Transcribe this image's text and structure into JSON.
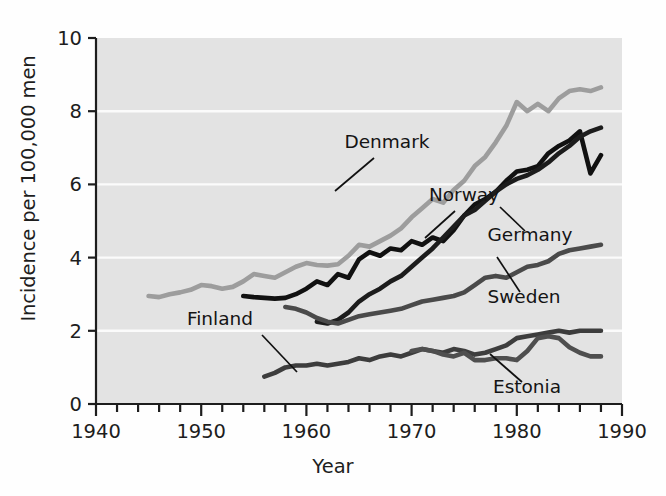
{
  "chart_data": {
    "type": "line",
    "title": "",
    "xlabel": "Year",
    "ylabel": "Incidence per 100,000 men",
    "xlim": [
      1940,
      1990
    ],
    "ylim": [
      0,
      10
    ],
    "xticks": [
      1940,
      1950,
      1960,
      1970,
      1980,
      1990
    ],
    "yticks": [
      0,
      2,
      4,
      6,
      8,
      10
    ],
    "xminor_step": 2,
    "grid": "horizontal-white-at-even-y",
    "legend": "inline-labels-with-leader-lines",
    "plot_background": "#e3e3e3",
    "series": [
      {
        "name": "Denmark",
        "color": "#9d9d9d",
        "x": [
          1945,
          1946,
          1947,
          1948,
          1949,
          1950,
          1951,
          1952,
          1953,
          1954,
          1955,
          1956,
          1957,
          1958,
          1959,
          1960,
          1961,
          1962,
          1963,
          1964,
          1965,
          1966,
          1967,
          1968,
          1969,
          1970,
          1971,
          1972,
          1973,
          1974,
          1975,
          1976,
          1977,
          1978,
          1979,
          1980,
          1981,
          1982,
          1983,
          1984,
          1985,
          1986,
          1987,
          1988
        ],
        "values": [
          2.95,
          2.92,
          3.0,
          3.05,
          3.12,
          3.25,
          3.22,
          3.15,
          3.2,
          3.35,
          3.55,
          3.5,
          3.45,
          3.6,
          3.75,
          3.85,
          3.8,
          3.78,
          3.82,
          4.05,
          4.35,
          4.3,
          4.45,
          4.6,
          4.8,
          5.1,
          5.35,
          5.6,
          5.5,
          5.85,
          6.1,
          6.5,
          6.75,
          7.15,
          7.6,
          8.25,
          8.0,
          8.2,
          8.0,
          8.35,
          8.55,
          8.6,
          8.55,
          8.65
        ]
      },
      {
        "name": "Norway",
        "color": "#111111",
        "x": [
          1954,
          1955,
          1956,
          1957,
          1958,
          1959,
          1960,
          1961,
          1962,
          1963,
          1964,
          1965,
          1966,
          1967,
          1968,
          1969,
          1970,
          1971,
          1972,
          1973,
          1974,
          1975,
          1976,
          1977,
          1978,
          1979,
          1980,
          1981,
          1982,
          1983,
          1984,
          1985,
          1986,
          1987,
          1988
        ],
        "values": [
          2.95,
          2.92,
          2.9,
          2.88,
          2.9,
          3.0,
          3.15,
          3.35,
          3.25,
          3.55,
          3.45,
          3.95,
          4.15,
          4.05,
          4.25,
          4.2,
          4.45,
          4.35,
          4.55,
          4.45,
          4.75,
          5.15,
          5.45,
          5.6,
          5.8,
          6.1,
          6.35,
          6.4,
          6.5,
          6.85,
          7.05,
          7.2,
          7.45,
          6.3,
          6.8
        ]
      },
      {
        "name": "Germany",
        "color": "#1c1c1c",
        "x": [
          1961,
          1962,
          1963,
          1964,
          1965,
          1966,
          1967,
          1968,
          1969,
          1970,
          1971,
          1972,
          1973,
          1974,
          1975,
          1976,
          1977,
          1978,
          1979,
          1980,
          1981,
          1982,
          1983,
          1984,
          1985,
          1986,
          1987,
          1988
        ],
        "values": [
          2.25,
          2.2,
          2.3,
          2.5,
          2.8,
          3.0,
          3.15,
          3.35,
          3.5,
          3.75,
          4.0,
          4.25,
          4.55,
          4.85,
          5.15,
          5.3,
          5.55,
          5.8,
          6.0,
          6.15,
          6.25,
          6.4,
          6.6,
          6.85,
          7.05,
          7.3,
          7.45,
          7.55
        ]
      },
      {
        "name": "Sweden",
        "color": "#4a4a4a",
        "x": [
          1958,
          1959,
          1960,
          1961,
          1962,
          1963,
          1964,
          1965,
          1966,
          1967,
          1968,
          1969,
          1970,
          1971,
          1972,
          1973,
          1974,
          1975,
          1976,
          1977,
          1978,
          1979,
          1980,
          1981,
          1982,
          1983,
          1984,
          1985,
          1986,
          1987,
          1988
        ],
        "values": [
          2.65,
          2.6,
          2.5,
          2.35,
          2.25,
          2.2,
          2.3,
          2.4,
          2.45,
          2.5,
          2.55,
          2.6,
          2.7,
          2.8,
          2.85,
          2.9,
          2.95,
          3.05,
          3.25,
          3.45,
          3.5,
          3.45,
          3.6,
          3.75,
          3.8,
          3.9,
          4.1,
          4.2,
          4.25,
          4.3,
          4.35
        ]
      },
      {
        "name": "Finland",
        "color": "#3d3d3d",
        "x": [
          1956,
          1957,
          1958,
          1959,
          1960,
          1961,
          1962,
          1963,
          1964,
          1965,
          1966,
          1967,
          1968,
          1969,
          1970,
          1971,
          1972,
          1973,
          1974,
          1975,
          1976,
          1977,
          1978,
          1979,
          1980,
          1981,
          1982,
          1983,
          1984,
          1985,
          1986,
          1987,
          1988
        ],
        "values": [
          0.75,
          0.85,
          1.0,
          1.05,
          1.05,
          1.1,
          1.05,
          1.1,
          1.15,
          1.25,
          1.2,
          1.3,
          1.35,
          1.3,
          1.4,
          1.5,
          1.45,
          1.4,
          1.5,
          1.45,
          1.35,
          1.4,
          1.5,
          1.6,
          1.8,
          1.85,
          1.9,
          1.95,
          2.0,
          1.95,
          2.0,
          2.0,
          2.0
        ]
      },
      {
        "name": "Estonia",
        "color": "#4f4f4f",
        "x": [
          1970,
          1971,
          1972,
          1973,
          1974,
          1975,
          1976,
          1977,
          1978,
          1979,
          1980,
          1981,
          1982,
          1983,
          1984,
          1985,
          1986,
          1987,
          1988
        ],
        "values": [
          1.45,
          1.5,
          1.45,
          1.35,
          1.3,
          1.4,
          1.2,
          1.2,
          1.25,
          1.25,
          1.2,
          1.45,
          1.8,
          1.85,
          1.8,
          1.55,
          1.4,
          1.3,
          1.3
        ]
      }
    ],
    "annotations": [
      {
        "label": "Denmark",
        "text_x": 387,
        "text_y": 148,
        "leader": [
          [
            374,
            158
          ],
          [
            335,
            191
          ]
        ]
      },
      {
        "label": "Norway",
        "text_x": 464,
        "text_y": 201,
        "leader": [
          [
            455,
            211
          ],
          [
            425,
            238
          ]
        ]
      },
      {
        "label": "Germany",
        "text_x": 530,
        "text_y": 241,
        "leader": [
          [
            525,
            231
          ],
          [
            500,
            207
          ]
        ]
      },
      {
        "label": "Sweden",
        "text_x": 524,
        "text_y": 303,
        "leader": [
          [
            520,
            292
          ],
          [
            497,
            257
          ]
        ]
      },
      {
        "label": "Finland",
        "text_x": 220,
        "text_y": 325,
        "leader": [
          [
            262,
            335
          ],
          [
            297,
            372
          ]
        ]
      },
      {
        "label": "Estonia",
        "text_x": 527,
        "text_y": 393,
        "leader": [
          [
            522,
            382
          ],
          [
            490,
            354
          ]
        ]
      }
    ]
  }
}
